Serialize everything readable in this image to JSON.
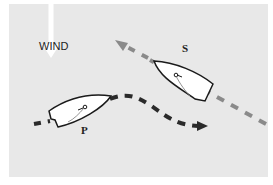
{
  "diagram": {
    "labels": {
      "wind": "WIND",
      "starboard_boat": "S",
      "port_boat": "P"
    },
    "colors": {
      "background": "#e8e8e8",
      "wind_arrow": "#ffffff",
      "port_track": "#2a2a2a",
      "starboard_track": "#8a8a8a",
      "hull_fill": "#ffffff",
      "hull_outline": "#1a1a1a"
    },
    "icons": {
      "wind": "down-arrow",
      "boat": "sailboat-hull"
    }
  }
}
